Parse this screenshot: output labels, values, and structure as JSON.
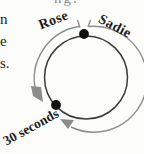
{
  "figure": {
    "runner_left": "Rose",
    "runner_right": "Sadie",
    "time_label": "30 seconds",
    "colors": {
      "track_circle": "#3a3a3a",
      "direction_arcs": "#8e8e8e",
      "arrowheads": "#8c8c8c",
      "dots": "#111111",
      "text": "#1c1c1c",
      "background": "#fcfcfb"
    }
  },
  "page_text_fragments": {
    "left_column": [
      "n",
      "e",
      "s."
    ],
    "top_cropped": "ng."
  }
}
